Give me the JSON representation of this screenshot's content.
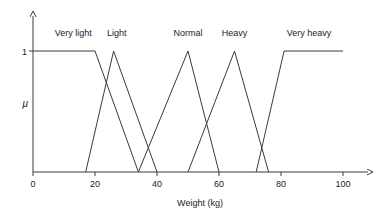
{
  "chart_data": {
    "type": "line",
    "title": "",
    "xlabel": "Weight (kg)",
    "ylabel": "μ",
    "xlim": [
      0,
      100
    ],
    "ylim": [
      0,
      1
    ],
    "grid": false,
    "legend_position": "inline-above-peaks",
    "xticks": [
      0,
      20,
      40,
      60,
      80,
      100
    ],
    "xtick_labels": [
      "0",
      "20",
      "40",
      "60",
      "80",
      "100"
    ],
    "yticks": [
      1
    ],
    "ytick_labels": [
      "1"
    ],
    "line_color": "#3a3a3a",
    "axis_color": "#3a3a3a",
    "series": [
      {
        "name": "Very light",
        "label_x": 13,
        "points": [
          [
            0,
            1
          ],
          [
            20,
            1
          ],
          [
            34,
            0
          ]
        ]
      },
      {
        "name": "Light",
        "label_x": 27,
        "points": [
          [
            17,
            0
          ],
          [
            26,
            1
          ],
          [
            40,
            0
          ]
        ]
      },
      {
        "name": "Normal",
        "label_x": 50,
        "points": [
          [
            34,
            0
          ],
          [
            50,
            1
          ],
          [
            60,
            0
          ]
        ]
      },
      {
        "name": "Heavy",
        "label_x": 65,
        "points": [
          [
            50,
            0
          ],
          [
            65,
            1
          ],
          [
            76,
            0
          ]
        ]
      },
      {
        "name": "Very heavy",
        "label_x": 89,
        "points": [
          [
            72,
            0
          ],
          [
            81,
            1
          ],
          [
            100,
            1
          ]
        ]
      }
    ]
  },
  "axes": {
    "x_title": "Weight (kg)",
    "y_title": "μ",
    "y_top_label": "1",
    "x_tick_labels": [
      "0",
      "20",
      "40",
      "60",
      "80",
      "100"
    ]
  },
  "labels": {
    "very_light": "Very light",
    "light": "Light",
    "normal": "Normal",
    "heavy": "Heavy",
    "very_heavy": "Very heavy"
  }
}
